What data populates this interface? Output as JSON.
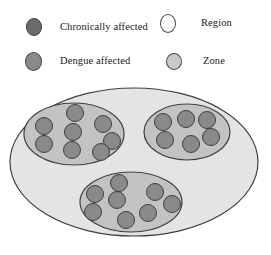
{
  "legend": {
    "items": [
      {
        "id": "chronically-affected",
        "label": "Chronically affected",
        "icon": "filled-circle-dark-gray",
        "color": "#6b6b6b",
        "stroke": "#3a3a3a"
      },
      {
        "id": "dengue-affected",
        "label": "Dengue affected",
        "icon": "filled-circle-medium-gray",
        "color": "#8a8a8a",
        "stroke": "#4a4a4a"
      },
      {
        "id": "region",
        "label": "Region",
        "icon": "outline-circle-white",
        "color": "#ffffff",
        "stroke": "#4a4a4a"
      },
      {
        "id": "zone",
        "label": "Zone",
        "icon": "filled-circle-light-gray",
        "color": "#c9c9c9",
        "stroke": "#4a4a4a"
      }
    ]
  },
  "diagram": {
    "type": "set-containment-venn",
    "region": {
      "name": "Region",
      "fill": "#e4e4e4",
      "stroke": "#3f3f3f",
      "cx": 134,
      "cy": 78,
      "rx": 124,
      "ry": 74
    },
    "zones": [
      {
        "name": "zone-left",
        "fill": "#c3c3c3",
        "stroke": "#3f3f3f",
        "cx": 74,
        "cy": 50,
        "rx": 50,
        "ry": 31,
        "dot_count": 8,
        "dots": [
          {
            "cx": 75,
            "cy": 29
          },
          {
            "cx": 44,
            "cy": 42
          },
          {
            "cx": 73,
            "cy": 48
          },
          {
            "cx": 103,
            "cy": 40
          },
          {
            "cx": 44,
            "cy": 60
          },
          {
            "cx": 72,
            "cy": 66
          },
          {
            "cx": 112,
            "cy": 57
          },
          {
            "cx": 101,
            "cy": 68
          }
        ]
      },
      {
        "name": "zone-right",
        "fill": "#c3c3c3",
        "stroke": "#3f3f3f",
        "cx": 187,
        "cy": 48,
        "rx": 43,
        "ry": 28,
        "dot_count": 6,
        "dots": [
          {
            "cx": 163,
            "cy": 38
          },
          {
            "cx": 186,
            "cy": 35
          },
          {
            "cx": 207,
            "cy": 36
          },
          {
            "cx": 165,
            "cy": 56
          },
          {
            "cx": 191,
            "cy": 60
          },
          {
            "cx": 211,
            "cy": 53
          }
        ]
      },
      {
        "name": "zone-bottom",
        "fill": "#c3c3c3",
        "stroke": "#3f3f3f",
        "cx": 131,
        "cy": 118,
        "rx": 51,
        "ry": 30,
        "dot_count": 8,
        "dots": [
          {
            "cx": 119,
            "cy": 99
          },
          {
            "cx": 95,
            "cy": 110
          },
          {
            "cx": 117,
            "cy": 116
          },
          {
            "cx": 93,
            "cy": 128
          },
          {
            "cx": 126,
            "cy": 136
          },
          {
            "cx": 155,
            "cy": 108
          },
          {
            "cx": 148,
            "cy": 129
          },
          {
            "cx": 172,
            "cy": 120
          }
        ]
      }
    ],
    "dot": {
      "name": "chronically-affected-dot",
      "fill": "#8a8a8a",
      "stroke": "#3f3f3f",
      "r": 8.5
    }
  }
}
